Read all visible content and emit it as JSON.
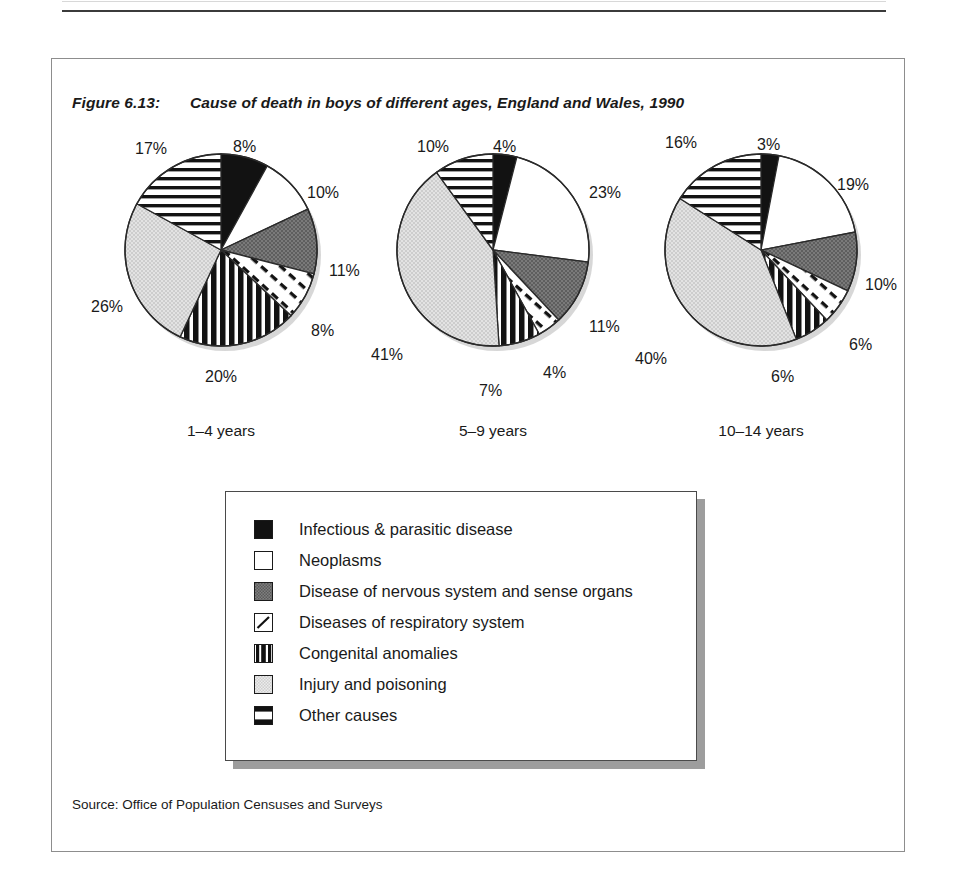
{
  "figure": {
    "number": "Figure 6.13:",
    "title": "Cause of death in boys of different ages, England and Wales, 1990",
    "source": "Source: Office of Population Censuses and Surveys"
  },
  "legend": {
    "items": [
      {
        "label": "Infectious & parasitic disease",
        "swatch": "solid-black-swatch",
        "color": "#121212"
      },
      {
        "label": "Neoplasms",
        "swatch": "white-swatch",
        "color": "#ffffff"
      },
      {
        "label": "Disease of nervous system and sense organs",
        "swatch": "dark-grey-swatch",
        "color": "#6e6e6e"
      },
      {
        "label": "Diseases of respiratory system",
        "swatch": "dashed-diagonal-swatch",
        "color": "#ffffff"
      },
      {
        "label": "Congenital anomalies",
        "swatch": "vertical-stripe-swatch",
        "color": "#111111"
      },
      {
        "label": "Injury and poisoning",
        "swatch": "light-grey-swatch",
        "color": "#d6d6d6"
      },
      {
        "label": "Other causes",
        "swatch": "horizontal-stripe-swatch",
        "color": "#111111"
      }
    ]
  },
  "chart_data": {
    "type": "pie",
    "title": "Cause of death in boys of different ages, England and Wales, 1990",
    "xlabel": "",
    "ylabel": "",
    "grid": false,
    "legend_position": "bottom",
    "units": "percent",
    "categories": [
      "Infectious & parasitic disease",
      "Neoplasms",
      "Disease of nervous system and sense organs",
      "Diseases of respiratory system",
      "Congenital anomalies",
      "Injury and poisoning",
      "Other causes"
    ],
    "series": [
      {
        "name": "1–4 years",
        "values": [
          8,
          10,
          11,
          8,
          20,
          26,
          17
        ],
        "labels": [
          "8%",
          "10%",
          "11%",
          "8%",
          "20%",
          "26%",
          "17%"
        ]
      },
      {
        "name": "5–9 years",
        "values": [
          4,
          23,
          11,
          4,
          7,
          41,
          10
        ],
        "labels": [
          "4%",
          "23%",
          "11%",
          "4%",
          "7%",
          "41%",
          "10%"
        ]
      },
      {
        "name": "10–14 years",
        "values": [
          3,
          19,
          10,
          6,
          6,
          40,
          16
        ],
        "labels": [
          "3%",
          "19%",
          "10%",
          "6%",
          "6%",
          "40%",
          "16%"
        ]
      }
    ]
  },
  "panels": [
    {
      "age_label": "1–4 years",
      "labels": [
        {
          "text": "8%",
          "x": 112,
          "y": -12
        },
        {
          "text": "10%",
          "x": 186,
          "y": 34
        },
        {
          "text": "11%",
          "x": 208,
          "y": 112
        },
        {
          "text": "8%",
          "x": 190,
          "y": 172
        },
        {
          "text": "20%",
          "x": 84,
          "y": 218
        },
        {
          "text": "26%",
          "x": -30,
          "y": 148
        },
        {
          "text": "17%",
          "x": 14,
          "y": -10
        }
      ]
    },
    {
      "age_label": "5–9 years",
      "labels": [
        {
          "text": "4%",
          "x": 100,
          "y": -12
        },
        {
          "text": "23%",
          "x": 196,
          "y": 34
        },
        {
          "text": "11%",
          "x": 196,
          "y": 168
        },
        {
          "text": "4%",
          "x": 150,
          "y": 214
        },
        {
          "text": "7%",
          "x": 86,
          "y": 232
        },
        {
          "text": "41%",
          "x": -22,
          "y": 196
        },
        {
          "text": "10%",
          "x": 24,
          "y": -12
        }
      ]
    },
    {
      "age_label": "10–14 years",
      "labels": [
        {
          "text": "3%",
          "x": 96,
          "y": -14
        },
        {
          "text": "19%",
          "x": 176,
          "y": 26
        },
        {
          "text": "10%",
          "x": 204,
          "y": 126
        },
        {
          "text": "6%",
          "x": 188,
          "y": 186
        },
        {
          "text": "6%",
          "x": 110,
          "y": 218
        },
        {
          "text": "40%",
          "x": -26,
          "y": 200
        },
        {
          "text": "16%",
          "x": 4,
          "y": -16
        }
      ]
    }
  ]
}
